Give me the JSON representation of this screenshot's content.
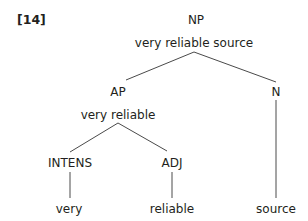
{
  "example_number": "[14]",
  "tree": {
    "root": {
      "category": "NP",
      "phrase": "very reliable source"
    },
    "ap": {
      "category": "AP",
      "phrase": "very reliable"
    },
    "n": {
      "category": "N",
      "word": "source"
    },
    "intens": {
      "category": "INTENS",
      "word": "very"
    },
    "adj": {
      "category": "ADJ",
      "word": "reliable"
    }
  },
  "colors": {
    "text": "#231f20",
    "line": "#4a4a4a",
    "background": "#ffffff"
  }
}
